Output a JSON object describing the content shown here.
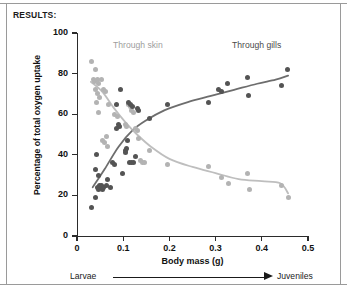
{
  "figure": {
    "title": "RESULTS:"
  },
  "progression": {
    "start_label": "Larvae",
    "end_label": "Juveniles",
    "arrow_icon": "right-arrow-icon"
  },
  "chart_data": {
    "type": "scatter",
    "title": "RESULTS:",
    "xlabel": "Body mass (g)",
    "ylabel": "Percentage of total oxygen uptake",
    "xlim": [
      0,
      0.5
    ],
    "ylim": [
      0,
      100
    ],
    "xticks": [
      "0",
      "0.1",
      "0.2",
      "0.3",
      "0.4",
      "0.5"
    ],
    "xtick_values": [
      0,
      0.1,
      0.2,
      0.3,
      0.4,
      0.5
    ],
    "yticks": [
      "0",
      "20",
      "40",
      "60",
      "80",
      "100"
    ],
    "ytick_values": [
      0,
      20,
      40,
      60,
      80,
      100
    ],
    "grid": false,
    "legend_position": "inline-annotations",
    "annotations": [
      {
        "text": "Through skin",
        "x": 0.1,
        "y": 92,
        "color": "#9d9d9d"
      },
      {
        "text": "Through gills",
        "x": 0.36,
        "y": 92,
        "color": "#4a4a4a"
      }
    ],
    "series": [
      {
        "name": "Through skin",
        "color": "#b3b3b3",
        "trend": "decreasing",
        "points": [
          [
            0.032,
            86
          ],
          [
            0.04,
            82
          ],
          [
            0.036,
            77
          ],
          [
            0.038,
            76
          ],
          [
            0.045,
            77
          ],
          [
            0.047,
            75
          ],
          [
            0.052,
            77
          ],
          [
            0.041,
            72
          ],
          [
            0.044,
            70
          ],
          [
            0.049,
            68
          ],
          [
            0.043,
            66
          ],
          [
            0.046,
            61
          ],
          [
            0.058,
            72
          ],
          [
            0.062,
            71
          ],
          [
            0.069,
            65
          ],
          [
            0.055,
            47
          ],
          [
            0.06,
            46
          ],
          [
            0.063,
            49
          ],
          [
            0.066,
            44
          ],
          [
            0.082,
            60
          ],
          [
            0.088,
            59
          ],
          [
            0.104,
            55
          ],
          [
            0.108,
            54
          ],
          [
            0.112,
            65
          ],
          [
            0.115,
            64
          ],
          [
            0.118,
            62
          ],
          [
            0.122,
            61
          ],
          [
            0.126,
            53
          ],
          [
            0.13,
            52
          ],
          [
            0.134,
            48
          ],
          [
            0.138,
            37
          ],
          [
            0.142,
            36
          ],
          [
            0.146,
            36
          ],
          [
            0.158,
            42
          ],
          [
            0.196,
            35
          ],
          [
            0.285,
            34
          ],
          [
            0.313,
            29
          ],
          [
            0.327,
            26
          ],
          [
            0.369,
            31
          ],
          [
            0.374,
            23
          ],
          [
            0.443,
            25
          ],
          [
            0.457,
            19
          ]
        ],
        "curve": [
          [
            0.03,
            76
          ],
          [
            0.055,
            71
          ],
          [
            0.08,
            63
          ],
          [
            0.105,
            56
          ],
          [
            0.13,
            50
          ],
          [
            0.16,
            44
          ],
          [
            0.2,
            38
          ],
          [
            0.25,
            34
          ],
          [
            0.3,
            31
          ],
          [
            0.35,
            28
          ],
          [
            0.4,
            27
          ],
          [
            0.44,
            26
          ],
          [
            0.457,
            21
          ]
        ]
      },
      {
        "name": "Through gills",
        "color": "#545454",
        "trend": "increasing",
        "points": [
          [
            0.031,
            14
          ],
          [
            0.04,
            19
          ],
          [
            0.044,
            24
          ],
          [
            0.046,
            23
          ],
          [
            0.048,
            25
          ],
          [
            0.05,
            24
          ],
          [
            0.054,
            25
          ],
          [
            0.056,
            23
          ],
          [
            0.058,
            24
          ],
          [
            0.041,
            33
          ],
          [
            0.043,
            40
          ],
          [
            0.047,
            30
          ],
          [
            0.063,
            25
          ],
          [
            0.066,
            28
          ],
          [
            0.072,
            24
          ],
          [
            0.076,
            36
          ],
          [
            0.082,
            35
          ],
          [
            0.086,
            53
          ],
          [
            0.09,
            55
          ],
          [
            0.092,
            54
          ],
          [
            0.086,
            65
          ],
          [
            0.095,
            72
          ],
          [
            0.098,
            31
          ],
          [
            0.104,
            42
          ],
          [
            0.106,
            41
          ],
          [
            0.108,
            43
          ],
          [
            0.11,
            47
          ],
          [
            0.114,
            36
          ],
          [
            0.118,
            36
          ],
          [
            0.122,
            36
          ],
          [
            0.126,
            39
          ],
          [
            0.112,
            66
          ],
          [
            0.116,
            65
          ],
          [
            0.12,
            64
          ],
          [
            0.131,
            63
          ],
          [
            0.134,
            62
          ],
          [
            0.156,
            58
          ],
          [
            0.196,
            65
          ],
          [
            0.285,
            66
          ],
          [
            0.307,
            72
          ],
          [
            0.313,
            71
          ],
          [
            0.325,
            75
          ],
          [
            0.368,
            78
          ],
          [
            0.372,
            69
          ],
          [
            0.442,
            74
          ],
          [
            0.456,
            82
          ]
        ],
        "curve": [
          [
            0.034,
            24
          ],
          [
            0.06,
            33
          ],
          [
            0.09,
            44
          ],
          [
            0.12,
            52
          ],
          [
            0.15,
            57
          ],
          [
            0.19,
            62
          ],
          [
            0.24,
            66
          ],
          [
            0.29,
            69
          ],
          [
            0.34,
            72
          ],
          [
            0.39,
            75
          ],
          [
            0.43,
            77
          ],
          [
            0.457,
            79
          ]
        ]
      }
    ]
  }
}
